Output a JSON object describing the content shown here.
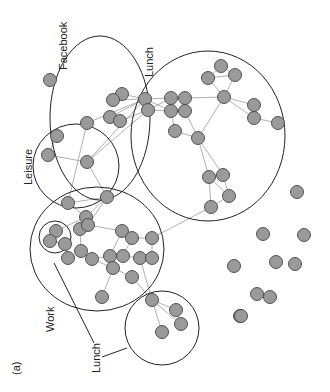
{
  "figure": {
    "panel_label": "(a)",
    "group_labels": {
      "facebook": "Facebook",
      "lunch_top": "Lunch",
      "leisure": "Leisure",
      "work": "Work",
      "lunch_bottom": "Lunch"
    }
  },
  "colors": {
    "node_fill": "#9a9a9a",
    "node_stroke": "#444444",
    "edge": "#9c9c9c",
    "group_outline": "#222222"
  },
  "groups": [
    {
      "name": "Facebook",
      "cx": 100,
      "cy": 118,
      "rx": 50,
      "ry": 82
    },
    {
      "name": "Lunch",
      "cx": 208,
      "cy": 136,
      "rx": 77,
      "ry": 85
    },
    {
      "name": "Leisure",
      "cx": 76,
      "cy": 166,
      "rx": 43,
      "ry": 42
    },
    {
      "name": "Work",
      "cx": 97,
      "cy": 249,
      "rx": 67,
      "ry": 62
    },
    {
      "name": "Work-sub",
      "cx": 55,
      "cy": 237,
      "rx": 16,
      "ry": 16
    },
    {
      "name": "Lunch",
      "cx": 162,
      "cy": 328,
      "rx": 37,
      "ry": 37
    }
  ],
  "nodes": [
    [
      50,
      80
    ],
    [
      122,
      94
    ],
    [
      113,
      100
    ],
    [
      110,
      117
    ],
    [
      120,
      121
    ],
    [
      87,
      123
    ],
    [
      57,
      136
    ],
    [
      48,
      155
    ],
    [
      87,
      162
    ],
    [
      145,
      99
    ],
    [
      148,
      110
    ],
    [
      171,
      98
    ],
    [
      171,
      111
    ],
    [
      185,
      98
    ],
    [
      185,
      111
    ],
    [
      175,
      131
    ],
    [
      198,
      138
    ],
    [
      208,
      78
    ],
    [
      221,
      66
    ],
    [
      235,
      75
    ],
    [
      224,
      97
    ],
    [
      254,
      105
    ],
    [
      254,
      118
    ],
    [
      278,
      123
    ],
    [
      209,
      177
    ],
    [
      223,
      175
    ],
    [
      229,
      196
    ],
    [
      211,
      207
    ],
    [
      68,
      203
    ],
    [
      107,
      197
    ],
    [
      86,
      217
    ],
    [
      56,
      231
    ],
    [
      50,
      241
    ],
    [
      65,
      244
    ],
    [
      68,
      258
    ],
    [
      80,
      229
    ],
    [
      88,
      225
    ],
    [
      122,
      231
    ],
    [
      132,
      238
    ],
    [
      152,
      238
    ],
    [
      81,
      251
    ],
    [
      92,
      259
    ],
    [
      110,
      256
    ],
    [
      123,
      256
    ],
    [
      140,
      258
    ],
    [
      152,
      258
    ],
    [
      113,
      268
    ],
    [
      132,
      277
    ],
    [
      102,
      297
    ],
    [
      152,
      300
    ],
    [
      176,
      310
    ],
    [
      181,
      324
    ],
    [
      162,
      332
    ],
    [
      297,
      192
    ],
    [
      304,
      235
    ],
    [
      263,
      234
    ],
    [
      276,
      262
    ],
    [
      234,
      266
    ],
    [
      295,
      264
    ],
    [
      257,
      294
    ],
    [
      270,
      297
    ],
    [
      240,
      316
    ],
    [
      241,
      316
    ]
  ],
  "edges": [
    [
      1,
      9
    ],
    [
      2,
      9
    ],
    [
      3,
      9
    ],
    [
      4,
      10
    ],
    [
      5,
      9
    ],
    [
      5,
      28
    ],
    [
      8,
      9
    ],
    [
      7,
      8
    ],
    [
      6,
      7
    ],
    [
      8,
      10
    ],
    [
      9,
      10
    ],
    [
      9,
      11
    ],
    [
      9,
      12
    ],
    [
      10,
      11
    ],
    [
      10,
      12
    ],
    [
      11,
      12
    ],
    [
      11,
      13
    ],
    [
      12,
      14
    ],
    [
      12,
      15
    ],
    [
      13,
      14
    ],
    [
      14,
      16
    ],
    [
      15,
      16
    ],
    [
      16,
      20
    ],
    [
      13,
      20
    ],
    [
      17,
      18
    ],
    [
      17,
      19
    ],
    [
      18,
      19
    ],
    [
      17,
      20
    ],
    [
      19,
      20
    ],
    [
      20,
      21
    ],
    [
      21,
      22
    ],
    [
      22,
      23
    ],
    [
      20,
      22
    ],
    [
      16,
      24
    ],
    [
      16,
      25
    ],
    [
      24,
      25
    ],
    [
      24,
      26
    ],
    [
      25,
      26
    ],
    [
      26,
      27
    ],
    [
      24,
      27
    ],
    [
      27,
      39
    ],
    [
      8,
      29
    ],
    [
      28,
      29
    ],
    [
      28,
      30
    ],
    [
      29,
      30
    ],
    [
      30,
      31
    ],
    [
      31,
      32
    ],
    [
      32,
      33
    ],
    [
      33,
      34
    ],
    [
      30,
      35
    ],
    [
      35,
      36
    ],
    [
      29,
      36
    ],
    [
      36,
      37
    ],
    [
      37,
      38
    ],
    [
      38,
      39
    ],
    [
      35,
      40
    ],
    [
      40,
      41
    ],
    [
      41,
      42
    ],
    [
      42,
      43
    ],
    [
      43,
      44
    ],
    [
      44,
      45
    ],
    [
      37,
      42
    ],
    [
      38,
      43
    ],
    [
      39,
      45
    ],
    [
      41,
      46
    ],
    [
      46,
      47
    ],
    [
      46,
      48
    ],
    [
      47,
      49
    ],
    [
      44,
      49
    ],
    [
      49,
      50
    ],
    [
      49,
      51
    ],
    [
      50,
      51
    ],
    [
      49,
      52
    ]
  ]
}
